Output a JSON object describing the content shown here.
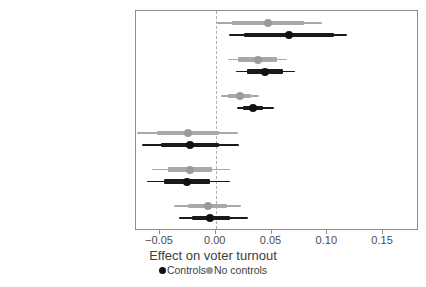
{
  "chart_data": {
    "type": "scatter",
    "title": "",
    "xlabel": "Effect on voter turnout",
    "ylabel": "",
    "xlim": [
      -0.0715,
      0.1822
    ],
    "xticks": [
      -0.05,
      0.0,
      0.05,
      0.1,
      0.15
    ],
    "xticklabels": [
      "−0.05",
      "0.00",
      "0.05",
      "0.10",
      "0.15"
    ],
    "grid": false,
    "zero_reference_line": 0.0,
    "legend_position": "bottom",
    "categories": [
      "Same-day registration",
      "Preregistration",
      "Online registration",
      "Election day registration",
      "Early voting",
      "Absentee voting"
    ],
    "series": [
      {
        "name": "Controls",
        "color": "#111111",
        "values": [
          0.066,
          0.044,
          0.033,
          -0.023,
          -0.026,
          -0.005
        ],
        "ci_low": [
          0.012,
          0.018,
          0.019,
          -0.066,
          -0.062,
          -0.033
        ],
        "ci_high": [
          0.118,
          0.071,
          0.052,
          0.021,
          0.013,
          0.029
        ],
        "ci_inner_low": [
          0.025,
          0.028,
          0.024,
          -0.049,
          -0.046,
          -0.021
        ],
        "ci_inner_high": [
          0.106,
          0.06,
          0.042,
          0.003,
          -0.005,
          0.013
        ]
      },
      {
        "name": "No controls",
        "color": "#9b9b9b",
        "values": [
          0.047,
          0.038,
          0.022,
          -0.025,
          -0.023,
          -0.007
        ],
        "ci_low": [
          0.001,
          0.011,
          0.005,
          -0.071,
          -0.057,
          -0.037
        ],
        "ci_high": [
          0.095,
          0.064,
          0.039,
          0.02,
          0.013,
          0.023
        ],
        "ci_inner_low": [
          0.015,
          0.02,
          0.011,
          -0.053,
          -0.043,
          -0.025
        ],
        "ci_inner_high": [
          0.079,
          0.055,
          0.032,
          0.003,
          -0.003,
          0.01
        ]
      }
    ]
  },
  "legend": {
    "items": [
      {
        "label": "Controls",
        "marker": "filled-circle-icon"
      },
      {
        "label": "No controls",
        "marker": "filled-circle-icon"
      }
    ]
  },
  "caption_sliver": ""
}
